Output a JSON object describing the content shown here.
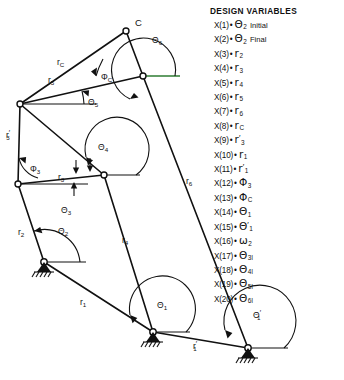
{
  "figure": {
    "legend": {
      "heading": "DESIGN VARIABLES",
      "items": [
        {
          "key": "X(1)",
          "sep": "•",
          "symbol": "Θ",
          "sub": "2",
          "prime": "",
          "suffix": "Initial"
        },
        {
          "key": "X(2)",
          "sep": "•",
          "symbol": "Θ",
          "sub": "2",
          "prime": "",
          "suffix": "Final"
        },
        {
          "key": "X(3)",
          "sep": "•",
          "symbol": "r",
          "sub": "2",
          "prime": "",
          "suffix": ""
        },
        {
          "key": "X(4)",
          "sep": "•",
          "symbol": "r",
          "sub": "3",
          "prime": "",
          "suffix": ""
        },
        {
          "key": "X(5)",
          "sep": "•",
          "symbol": "r",
          "sub": "4",
          "prime": "",
          "suffix": ""
        },
        {
          "key": "X(6)",
          "sep": "•",
          "symbol": "r",
          "sub": "5",
          "prime": "",
          "suffix": ""
        },
        {
          "key": "X(7)",
          "sep": "•",
          "symbol": "r",
          "sub": "6",
          "prime": "",
          "suffix": ""
        },
        {
          "key": "X(8)",
          "sep": "•",
          "symbol": "r",
          "sub": "C",
          "prime": "",
          "suffix": ""
        },
        {
          "key": "X(9)",
          "sep": "•",
          "symbol": "r",
          "sub": "3",
          "prime": "′",
          "suffix": ""
        },
        {
          "key": "X(10)",
          "sep": "•",
          "symbol": "r",
          "sub": "1",
          "prime": "",
          "suffix": ""
        },
        {
          "key": "X(11)",
          "sep": "•",
          "symbol": "r",
          "sub": "1",
          "prime": "′",
          "suffix": ""
        },
        {
          "key": "X(12)",
          "sep": "•",
          "symbol": "Φ",
          "sub": "3",
          "prime": "",
          "suffix": ""
        },
        {
          "key": "X(13)",
          "sep": "•",
          "symbol": "Φ",
          "sub": "C",
          "prime": "",
          "suffix": ""
        },
        {
          "key": "X(14)",
          "sep": "•",
          "symbol": "Θ",
          "sub": "1",
          "prime": "",
          "suffix": ""
        },
        {
          "key": "X(15)",
          "sep": "•",
          "symbol": "Θ",
          "sub": "1",
          "prime": "′",
          "suffix": ""
        },
        {
          "key": "X(16)",
          "sep": "•",
          "symbol": "ω",
          "sub": "2",
          "prime": "",
          "suffix": ""
        },
        {
          "key": "X(17)",
          "sep": "•",
          "symbol": "Θ",
          "sub": "3I",
          "prime": "",
          "suffix": ""
        },
        {
          "key": "X(18)",
          "sep": "•",
          "symbol": "Θ",
          "sub": "4I",
          "prime": "",
          "suffix": ""
        },
        {
          "key": "X(19)",
          "sep": "•",
          "symbol": "Θ",
          "sub": "5I",
          "prime": "",
          "suffix": ""
        },
        {
          "key": "X(20)",
          "sep": "•",
          "symbol": "Θ",
          "sub": "6I",
          "prime": "",
          "suffix": ""
        }
      ]
    },
    "colors": {
      "ink": "#111111",
      "reference_line": "#2e7d32",
      "background": "#ffffff"
    },
    "points": {
      "O1": {
        "x": 44,
        "y": 262,
        "label": "",
        "type": "ground-pivot"
      },
      "A": {
        "x": 20,
        "y": 104,
        "label": "",
        "type": "pin"
      },
      "B": {
        "x": 18,
        "y": 184,
        "label": "",
        "type": "pin"
      },
      "D": {
        "x": 104,
        "y": 175,
        "label": "",
        "type": "pin"
      },
      "C": {
        "x": 126,
        "y": 31,
        "label": "C",
        "type": "pin"
      },
      "E": {
        "x": 143,
        "y": 76,
        "label": "",
        "type": "pin"
      },
      "O4": {
        "x": 153,
        "y": 332,
        "label": "",
        "type": "ground-pivot"
      },
      "O6": {
        "x": 248,
        "y": 348,
        "label": "",
        "type": "ground-pivot"
      }
    },
    "links": [
      {
        "name": "r2",
        "from": "O1",
        "to": "B"
      },
      {
        "name": "r3",
        "from": "B",
        "to": "D"
      },
      {
        "name": "r3prime",
        "from": "B",
        "to": "A"
      },
      {
        "name": "rC",
        "from": "A",
        "to": "C"
      },
      {
        "name": "r5",
        "from": "A",
        "to": "E"
      },
      {
        "name": "C-E",
        "from": "C",
        "to": "E"
      },
      {
        "name": "r6",
        "from": "E",
        "to": "O6"
      },
      {
        "name": "A-D",
        "from": "A",
        "to": "D"
      },
      {
        "name": "r4",
        "from": "D",
        "to": "O4"
      },
      {
        "name": "r1",
        "from": "O1",
        "to": "O4"
      },
      {
        "name": "r1prime",
        "from": "O4",
        "to": "O6"
      }
    ],
    "link_labels": [
      {
        "text": "r",
        "sub": "C",
        "prime": "",
        "x": 57,
        "y": 65
      },
      {
        "text": "r",
        "sub": "5",
        "prime": "",
        "x": 48,
        "y": 83
      },
      {
        "text": "r",
        "sub": "3",
        "prime": "′",
        "x": 6,
        "y": 138
      },
      {
        "text": "r",
        "sub": "3",
        "prime": "",
        "x": 58,
        "y": 180
      },
      {
        "text": "r",
        "sub": "2",
        "prime": "",
        "x": 18,
        "y": 235
      },
      {
        "text": "r",
        "sub": "4",
        "prime": "",
        "x": 122,
        "y": 243
      },
      {
        "text": "r",
        "sub": "6",
        "prime": "",
        "x": 186,
        "y": 184
      },
      {
        "text": "r",
        "sub": "1",
        "prime": "",
        "x": 80,
        "y": 305
      },
      {
        "text": "r",
        "sub": "1",
        "prime": "′",
        "x": 193,
        "y": 349
      }
    ],
    "angle_labels": [
      {
        "symbol": "Θ",
        "sub": "6",
        "prime": "",
        "x": 152,
        "y": 43
      },
      {
        "symbol": "Φ",
        "sub": "C",
        "prime": "",
        "x": 101,
        "y": 80
      },
      {
        "symbol": "Θ",
        "sub": "5",
        "prime": "",
        "x": 88,
        "y": 105
      },
      {
        "symbol": "Θ",
        "sub": "4",
        "prime": "",
        "x": 98,
        "y": 150
      },
      {
        "symbol": "Φ",
        "sub": "3",
        "prime": "",
        "x": 30,
        "y": 172
      },
      {
        "symbol": "Θ",
        "sub": "3",
        "prime": "",
        "x": 61,
        "y": 213
      },
      {
        "symbol": "Θ",
        "sub": "2",
        "prime": "",
        "x": 58,
        "y": 234
      },
      {
        "symbol": "Θ",
        "sub": "1",
        "prime": "",
        "x": 157,
        "y": 308
      },
      {
        "symbol": "Θ",
        "sub": "1",
        "prime": "′",
        "x": 253,
        "y": 318
      }
    ],
    "vertex_labels": [
      {
        "text": "C",
        "x": 135,
        "y": 26
      }
    ]
  }
}
